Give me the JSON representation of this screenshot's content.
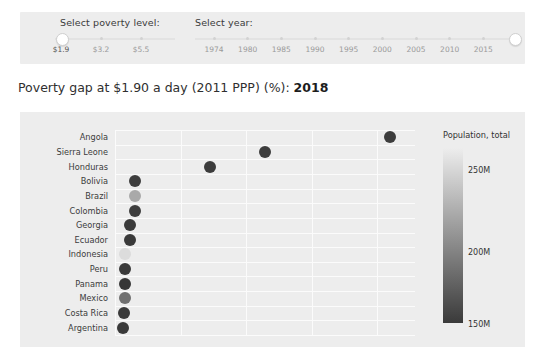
{
  "controls": {
    "poverty": {
      "label": "Select poverty level:",
      "options": [
        "$1.9",
        "$3.2",
        "$5.5"
      ],
      "selected": "$1.9"
    },
    "year": {
      "label": "Select year:",
      "ticks": [
        "1974",
        "1980",
        "1985",
        "1990",
        "1995",
        "2000",
        "2005",
        "2010",
        "2015"
      ],
      "selected": "2018"
    }
  },
  "title": {
    "prefix": "Poverty gap at $1.90 a day (2011 PPP) (%): ",
    "year": "2018"
  },
  "legend": {
    "title": "Population, total",
    "ticks": [
      "250M",
      "200M",
      "150M"
    ],
    "gradient_top": "#ededed",
    "gradient_bottom": "#3a3a3a"
  },
  "chart_data": {
    "type": "scatter",
    "title": "Poverty gap at $1.90 a day (2011 PPP) (%): 2018",
    "xlabel": "",
    "ylabel": "",
    "xlim": [
      0,
      60
    ],
    "grid": true,
    "legend_position": "right",
    "color_by": "Population, total",
    "color_scale_min": "150M",
    "color_scale_max": "250M",
    "categories": [
      "Angola",
      "Sierra Leone",
      "Honduras",
      "Bolivia",
      "Brazil",
      "Colombia",
      "Georgia",
      "Ecuador",
      "Indonesia",
      "Peru",
      "Panama",
      "Mexico",
      "Costa Rica",
      "Argentina"
    ],
    "points": [
      {
        "country": "Angola",
        "x": 55.0,
        "color": "#3d3d3d"
      },
      {
        "country": "Sierra Leone",
        "x": 30.0,
        "color": "#3d3d3d"
      },
      {
        "country": "Honduras",
        "x": 19.0,
        "color": "#3b3b3b"
      },
      {
        "country": "Bolivia",
        "x": 4.0,
        "color": "#3e3e3e"
      },
      {
        "country": "Brazil",
        "x": 4.0,
        "color": "#a9a9a9"
      },
      {
        "country": "Colombia",
        "x": 4.0,
        "color": "#3e3e3e"
      },
      {
        "country": "Georgia",
        "x": 3.0,
        "color": "#3a3a3a"
      },
      {
        "country": "Ecuador",
        "x": 3.0,
        "color": "#3a3a3a"
      },
      {
        "country": "Indonesia",
        "x": 2.0,
        "color": "#dcdcdc"
      },
      {
        "country": "Peru",
        "x": 2.0,
        "color": "#3a3a3a"
      },
      {
        "country": "Panama",
        "x": 2.0,
        "color": "#363636"
      },
      {
        "country": "Mexico",
        "x": 2.0,
        "color": "#707070"
      },
      {
        "country": "Costa Rica",
        "x": 1.8,
        "color": "#3a3a3a"
      },
      {
        "country": "Argentina",
        "x": 1.5,
        "color": "#3a3a3a"
      }
    ]
  }
}
